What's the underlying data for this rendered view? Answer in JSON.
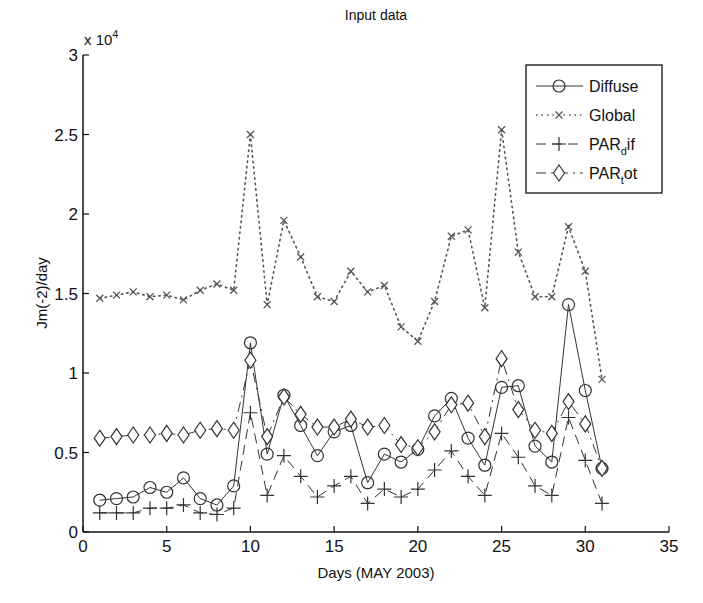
{
  "chart_data": {
    "type": "line",
    "title": "Input data",
    "xlabel": "Days (MAY 2003)",
    "ylabel": "Jm(-2)/day",
    "y_multiplier_label": "x 10",
    "y_multiplier_exp": "4",
    "xlim": [
      0,
      35
    ],
    "ylim": [
      0,
      3
    ],
    "grid": false,
    "legend_position": "upper right",
    "x_ticks": [
      0,
      5,
      10,
      15,
      20,
      25,
      30,
      35
    ],
    "y_ticks": [
      0,
      0.5,
      1,
      1.5,
      2,
      2.5,
      3
    ],
    "y_tick_labels": [
      "0",
      "0.5",
      "1",
      "1.5",
      "2",
      "2.5",
      "3"
    ],
    "x": [
      1,
      2,
      3,
      4,
      5,
      6,
      7,
      8,
      9,
      10,
      11,
      12,
      13,
      14,
      15,
      16,
      17,
      18,
      19,
      20,
      21,
      22,
      23,
      24,
      25,
      26,
      27,
      28,
      29,
      30,
      31
    ],
    "series": [
      {
        "name": "Diffuse",
        "legend_main": "Diffuse",
        "legend_sub": "",
        "legend_tail": "",
        "style": "solid",
        "marker": "circle",
        "values": [
          0.2,
          0.21,
          0.22,
          0.28,
          0.25,
          0.34,
          0.21,
          0.17,
          0.29,
          1.19,
          0.49,
          0.86,
          0.67,
          0.48,
          0.63,
          0.67,
          0.31,
          0.49,
          0.44,
          0.52,
          0.73,
          0.84,
          0.59,
          0.42,
          0.91,
          0.92,
          0.54,
          0.44,
          1.43,
          0.89,
          0.4
        ]
      },
      {
        "name": "Global",
        "legend_main": "Global",
        "legend_sub": "",
        "legend_tail": "",
        "style": "dotted",
        "marker": "x",
        "values": [
          1.47,
          1.49,
          1.51,
          1.48,
          1.49,
          1.46,
          1.52,
          1.56,
          1.52,
          2.5,
          1.43,
          1.96,
          1.73,
          1.48,
          1.45,
          1.64,
          1.51,
          1.55,
          1.29,
          1.2,
          1.45,
          1.86,
          1.9,
          1.41,
          2.53,
          1.76,
          1.48,
          1.48,
          1.92,
          1.64,
          0.96
        ]
      },
      {
        "name": "PAR_dif",
        "legend_main": "PAR",
        "legend_sub": "d",
        "legend_tail": "if",
        "style": "dashed",
        "marker": "plus",
        "values": [
          0.12,
          0.12,
          0.12,
          0.15,
          0.15,
          0.17,
          0.12,
          0.11,
          0.15,
          0.75,
          0.23,
          0.48,
          0.35,
          0.22,
          0.29,
          0.35,
          0.18,
          0.27,
          0.22,
          0.27,
          0.39,
          0.51,
          0.35,
          0.23,
          0.62,
          0.47,
          0.29,
          0.23,
          0.72,
          0.45,
          0.18
        ]
      },
      {
        "name": "PAR_tot",
        "legend_main": "PAR",
        "legend_sub": "t",
        "legend_tail": "ot",
        "style": "dashdot",
        "marker": "diamond",
        "values": [
          0.59,
          0.6,
          0.61,
          0.61,
          0.62,
          0.61,
          0.64,
          0.65,
          0.64,
          1.08,
          0.6,
          0.85,
          0.74,
          0.66,
          0.66,
          0.71,
          0.66,
          0.67,
          0.55,
          0.53,
          0.63,
          0.8,
          0.81,
          0.6,
          1.09,
          0.77,
          0.64,
          0.62,
          0.82,
          0.68,
          0.4
        ]
      }
    ],
    "colors": {
      "line": "#333333",
      "axis": "#111111",
      "global": "#555555"
    }
  }
}
